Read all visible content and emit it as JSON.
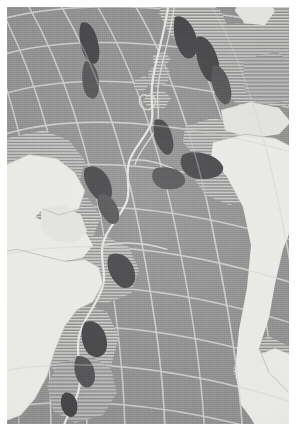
{
  "figure": {
    "kind": "map",
    "projection": "oblique curved graticule (conic/azimuthal style)",
    "border": {
      "color": "#ffffff",
      "width_px": 7
    }
  },
  "palette": {
    "paper": "#ffffff",
    "ocean_fill": "#8d8d8d",
    "grid_line": "#cfcfcf",
    "land_fill": "#ededea",
    "shelf_hatch_line": "#c6c6c3",
    "ridge_dark": "#3f3f42",
    "ridge_axis": "#e9e9e6"
  },
  "legend_text": {
    "ocean": "Ocean basin (solid tone)",
    "shelf": "Continental shelf / hatched zone",
    "land": "Land area (unfilled)",
    "ridge_axis": "Mid-Atlantic Ridge axis",
    "ridge_features": "Deep / ridge-crest features (dark)"
  },
  "features": [
    {
      "name": "North America",
      "type": "land",
      "fill": "unfilled-white",
      "position": "left-center"
    },
    {
      "name": "South America",
      "type": "land",
      "fill": "unfilled-white",
      "position": "lower-left"
    },
    {
      "name": "Africa",
      "type": "land",
      "fill": "unfilled-white",
      "position": "right-center"
    },
    {
      "name": "Europe",
      "type": "shelf-hatched",
      "fill": "horizontal-hatch",
      "position": "upper-right"
    },
    {
      "name": "British Isles",
      "type": "shelf-hatched",
      "fill": "horizontal-hatch",
      "position": "upper-center"
    },
    {
      "name": "Greenland",
      "type": "shelf-hatched",
      "fill": "horizontal-hatch",
      "position": "top-right"
    },
    {
      "name": "Iceland",
      "type": "shelf-hatched",
      "fill": "horizontal-hatch",
      "position": "top-center"
    },
    {
      "name": "Mid-Atlantic Ridge",
      "type": "ridge-axis",
      "fill": "light-line",
      "position": "center, running north-south"
    }
  ],
  "graticule": {
    "meridian_count": 11,
    "parallel_count": 13,
    "style": "curved",
    "stroke": "#cfcfcf"
  }
}
